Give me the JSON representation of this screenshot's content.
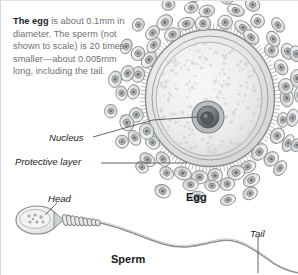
{
  "figure": {
    "background_color": "#ffffff",
    "border_color": "#d8d8d8"
  },
  "caption": {
    "lead_bold": "The egg",
    "body": " is about 0.1mm in diameter. The sperm (not shown to scale) is 20 times smaller—about 0.005mm long, including the tail.",
    "full_text": "The egg is about 0.1mm in diameter. The sperm (not shown to scale) is 20 times smaller—about 0.005mm long, including the tail.",
    "text_color": "#6e7073",
    "bold_color": "#20232a"
  },
  "labels": {
    "nucleus": "Nucleus",
    "protective_layer": "Protective layer",
    "egg": "Egg",
    "head": "Head",
    "tail": "Tail",
    "sperm": "Sperm"
  },
  "illustrations": {
    "egg": {
      "name": "egg-cell-illustration",
      "parts": [
        "corona-radiata-cells",
        "zona-pellucida",
        "cytoplasm",
        "nucleus"
      ],
      "fill_color": "#e6e7e6",
      "outline_color": "#8c8f92",
      "nucleus_color": "#5d6064"
    },
    "sperm": {
      "name": "sperm-cell-illustration",
      "parts": [
        "head",
        "midpiece",
        "tail"
      ],
      "fill_color": "#eeefee",
      "outline_color": "#8c8f92"
    }
  },
  "leader_lines": [
    {
      "name": "nucleus-leader",
      "from": "Nucleus",
      "to": "nucleus"
    },
    {
      "name": "protective-layer-leader",
      "from": "Protective layer",
      "to": "corona-radiata-cells"
    },
    {
      "name": "head-leader",
      "from": "Head",
      "to": "sperm-head"
    },
    {
      "name": "tail-leader",
      "from": "Tail",
      "to": "sperm-tail"
    }
  ]
}
